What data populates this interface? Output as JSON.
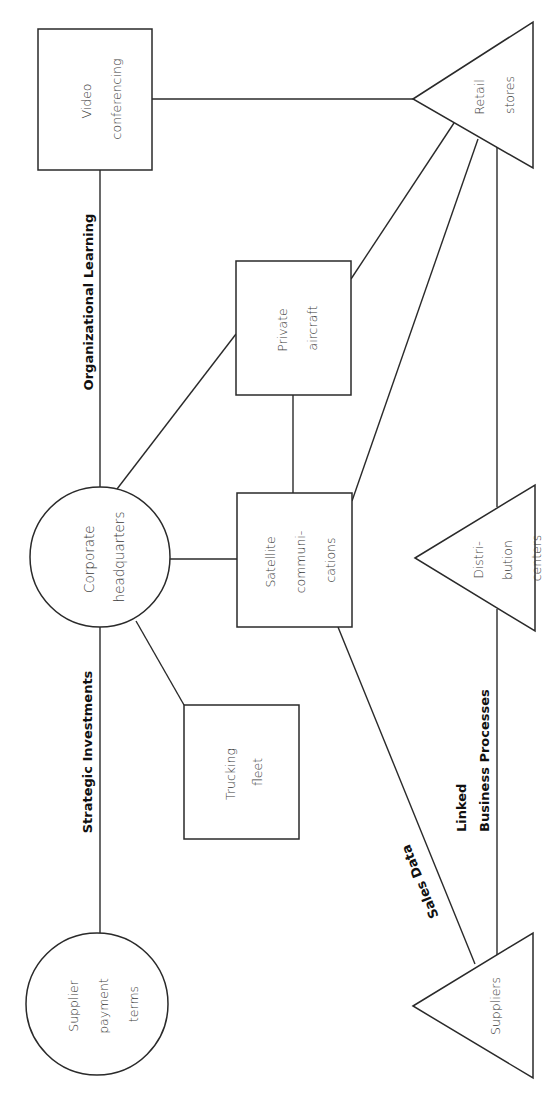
{
  "diagram": {
    "orientation": "rotated-90-ccw",
    "colors": {
      "stroke": "#2a2a2a",
      "text": "#3a3a3a",
      "label": "#111111",
      "background": "#ffffff"
    },
    "nodes": {
      "video_conferencing": {
        "shape": "rectangle",
        "line1": "Video",
        "line2": "conferencing"
      },
      "retail_stores": {
        "shape": "triangle",
        "line1": "Retail",
        "line2": "stores"
      },
      "private_aircraft": {
        "shape": "rectangle",
        "line1": "Private",
        "line2": "aircraft"
      },
      "corporate_headquarters": {
        "shape": "circle",
        "line1": "Corporate",
        "line2": "headquarters"
      },
      "satellite_communications": {
        "shape": "rectangle",
        "line1": "Satellite",
        "line2": "communi-",
        "line3": "cations"
      },
      "distribution_centers": {
        "shape": "triangle",
        "line1": "Distri-",
        "line2": "bution",
        "line3": "centers"
      },
      "trucking_fleet": {
        "shape": "rectangle",
        "line1": "Trucking",
        "line2": "fleet"
      },
      "supplier_payment_terms": {
        "shape": "circle",
        "line1": "Supplier",
        "line2": "payment",
        "line3": "terms"
      },
      "suppliers": {
        "shape": "triangle",
        "line1": "Suppliers"
      }
    },
    "edge_labels": {
      "organizational_learning": "Organizational Learning",
      "strategic_investments": "Strategic Investments",
      "linked_line1": "Linked",
      "linked_line2": "Business Processes",
      "sales_data": "Sales Data"
    },
    "edges": [
      [
        "video_conferencing",
        "retail_stores"
      ],
      [
        "video_conferencing",
        "corporate_headquarters"
      ],
      [
        "corporate_headquarters",
        "supplier_payment_terms"
      ],
      [
        "corporate_headquarters",
        "private_aircraft"
      ],
      [
        "corporate_headquarters",
        "satellite_communications"
      ],
      [
        "corporate_headquarters",
        "trucking_fleet"
      ],
      [
        "private_aircraft",
        "satellite_communications"
      ],
      [
        "private_aircraft",
        "retail_stores"
      ],
      [
        "satellite_communications",
        "retail_stores"
      ],
      [
        "satellite_communications",
        "suppliers"
      ],
      [
        "retail_stores",
        "distribution_centers"
      ],
      [
        "distribution_centers",
        "suppliers"
      ]
    ]
  }
}
